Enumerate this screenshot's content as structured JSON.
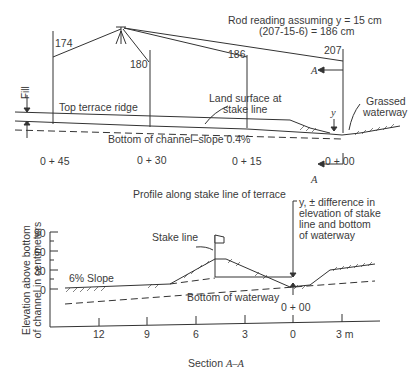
{
  "upper_profile": {
    "rod_note_line1": "Rod reading assuming y = 15 cm",
    "rod_note_line2": "(207-15-6) = 186 cm",
    "rod_readings": [
      "174",
      "180",
      "186",
      "207"
    ],
    "fill_label": "Fill",
    "top_ridge_label": "Top terrace ridge",
    "land_surface_label_1": "Land surface at",
    "land_surface_label_2": "stake line",
    "grassed_label_1": "Grassed",
    "grassed_label_2": "waterway",
    "y_label": "y",
    "section_marker": "A",
    "channel_bottom_label": "Bottom of channel–slope 0.4%",
    "stations": [
      "0 + 45",
      "0 + 30",
      "0 + 15",
      "0 + 00"
    ],
    "caption": "Profile along stake line of terrace"
  },
  "lower_section": {
    "y_axis_label_1": "Elevation above bottom",
    "y_axis_label_2": "of channel in centimeters",
    "y_ticks": [
      "90",
      "60",
      "30",
      "0"
    ],
    "x_ticks": [
      "12",
      "9",
      "6",
      "3",
      "0",
      "3 m"
    ],
    "slope_label": "6% Slope",
    "stake_line_label": "Stake line",
    "y_note_1": "y, ± difference in",
    "y_note_2": "elevation of stake",
    "y_note_3": "line and bottom",
    "y_note_4": "of waterway",
    "bottom_label": "Bottom of waterway",
    "station_label": "0 + 00",
    "caption_prefix": "Section ",
    "caption_italic": "A–A"
  }
}
